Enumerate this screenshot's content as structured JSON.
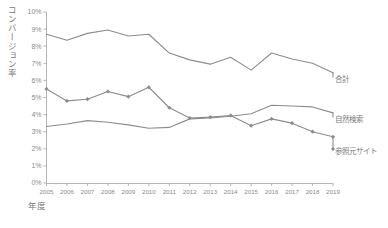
{
  "chart_data": {
    "type": "line",
    "title": "",
    "xlabel": "年度",
    "ylabel": "コンバージョン率",
    "categories": [
      "2005",
      "2006",
      "2007",
      "2008",
      "2009",
      "2010",
      "2011",
      "2012",
      "2013",
      "2014",
      "2015",
      "2016",
      "2017",
      "2018",
      "2019"
    ],
    "ylim": [
      0,
      10
    ],
    "yticks": [
      "0%",
      "1%",
      "2%",
      "3%",
      "4%",
      "5%",
      "6%",
      "7%",
      "8%",
      "9%",
      "10%"
    ],
    "ytick_values": [
      0,
      1,
      2,
      3,
      4,
      5,
      6,
      7,
      8,
      9,
      10
    ],
    "grid": false,
    "legend_position": "right-inline",
    "series": [
      {
        "name": "合計",
        "marker": "none",
        "color": "#8c8c8c",
        "values": [
          8.7,
          8.35,
          8.75,
          8.95,
          8.6,
          8.7,
          7.6,
          7.2,
          6.95,
          7.35,
          6.6,
          7.6,
          7.25,
          7.0,
          6.45
        ]
      },
      {
        "name": "自然検索",
        "marker": "none",
        "color": "#8c8c8c",
        "values": [
          3.3,
          3.45,
          3.65,
          3.55,
          3.4,
          3.2,
          3.25,
          3.75,
          3.8,
          3.9,
          4.05,
          4.55,
          4.5,
          4.45,
          4.1
        ]
      },
      {
        "name": "参照元サイト",
        "marker": "diamond",
        "color": "#8c8c8c",
        "values": [
          5.5,
          4.8,
          4.9,
          5.35,
          5.05,
          5.6,
          4.4,
          3.8,
          3.85,
          3.95,
          3.35,
          3.75,
          3.5,
          3.0,
          2.7
        ]
      }
    ]
  },
  "axis": {
    "ylabel_text": "コンバージョン率",
    "xlabel_text": "年度"
  },
  "legend": {
    "total": "合計",
    "organic": "自然検索",
    "referral": "参照元サイト"
  },
  "colors": {
    "line": "#8c8c8c",
    "axis": "#b5b5b5",
    "text": "#7a7a7a"
  }
}
